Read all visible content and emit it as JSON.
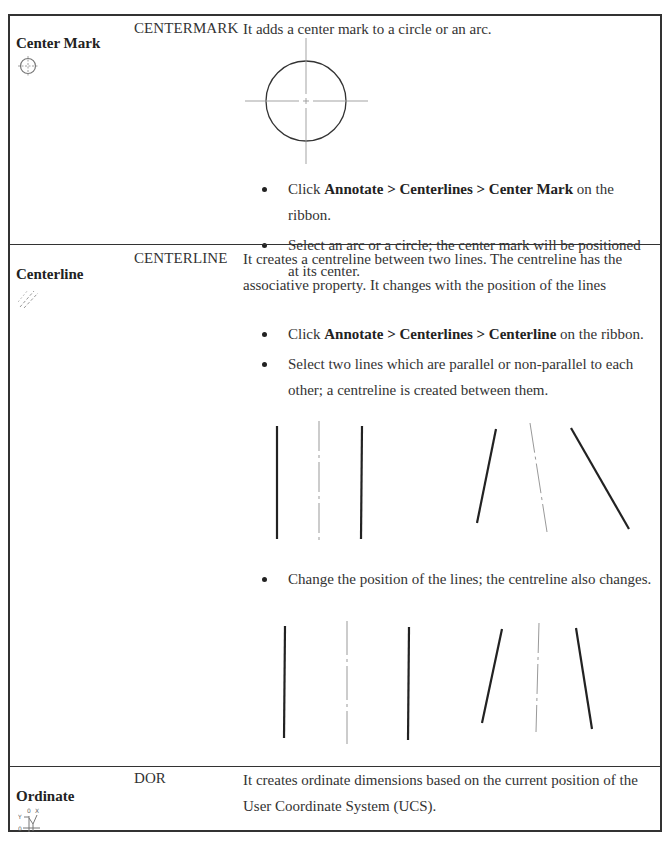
{
  "rows": [
    {
      "tool_name": "Center Mark",
      "icon": "center-mark-icon",
      "command": "CENTERMARK",
      "description": "It adds a center mark to a circle or an arc.",
      "steps": [
        {
          "prefix": "Click ",
          "bold": "Annotate > Centerlines > Center Mark",
          "suffix": " on the ribbon."
        },
        {
          "prefix": "Select an arc or a circle; the center mark will be positioned at its center.",
          "bold": "",
          "suffix": ""
        }
      ],
      "figure": "circle-with-center-mark"
    },
    {
      "tool_name": "Centerline",
      "icon": "centerline-icon",
      "command": "CENTERLINE",
      "description": "It creates a centreline between two lines. The centreline has the associative property. It changes with the position of the lines",
      "steps": [
        {
          "prefix": "Click ",
          "bold": "Annotate > Centerlines > Centerline",
          "suffix": " on the ribbon."
        },
        {
          "prefix": "Select two lines which are parallel or non-parallel to each other; a centreline is created between them.",
          "bold": "",
          "suffix": ""
        }
      ],
      "figure_1": "parallel-and-nonparallel-lines-with-centerlines",
      "step_after_figure": "Change the position of the lines; the centreline also changes.",
      "figure_2": "repositioned-lines-with-centerlines"
    },
    {
      "tool_name": "Ordinate",
      "icon": "ordinate-icon",
      "command": "DOR",
      "description": "It creates ordinate dimensions based on the current position of the User Coordinate System (UCS)."
    }
  ]
}
